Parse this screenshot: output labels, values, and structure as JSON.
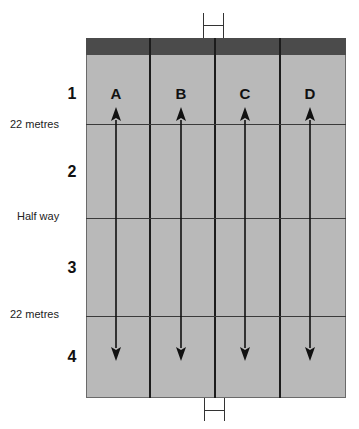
{
  "diagram": {
    "title": "",
    "colors": {
      "field": "#b9b9b9",
      "end_band": "#4b4b4b",
      "lines": "#1c1c1c",
      "text": "#111111"
    },
    "zones": [
      {
        "number": "1"
      },
      {
        "number": "2"
      },
      {
        "number": "3"
      },
      {
        "number": "4"
      }
    ],
    "side_labels": [
      {
        "text": "22 metres"
      },
      {
        "text": "Half way"
      },
      {
        "text": "22 metres"
      }
    ],
    "lanes": [
      {
        "letter": "A",
        "arrow": "bidirectional-vertical"
      },
      {
        "letter": "B",
        "arrow": "bidirectional-vertical"
      },
      {
        "letter": "C",
        "arrow": "bidirectional-vertical"
      },
      {
        "letter": "D",
        "arrow": "bidirectional-vertical"
      }
    ],
    "goal_posts": [
      "top",
      "bottom"
    ]
  }
}
